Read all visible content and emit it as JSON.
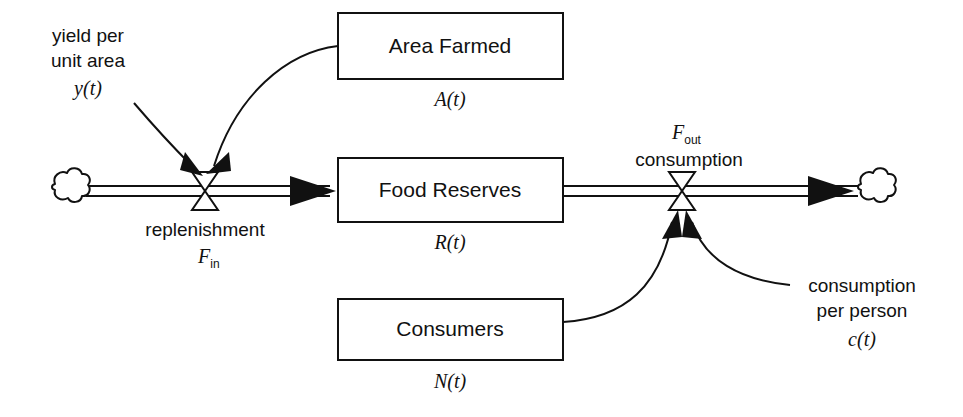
{
  "diagram": {
    "type": "system-dynamics-stock-and-flow",
    "colors": {
      "stroke": "#111111",
      "fill": "#ffffff",
      "background": "#ffffff"
    },
    "stocks": [
      {
        "id": "area-farmed",
        "label": "Area Farmed",
        "variable": "A(t)",
        "x": 338,
        "y": 13,
        "width": 225,
        "height": 66
      },
      {
        "id": "food-reserves",
        "label": "Food Reserves",
        "variable": "R(t)",
        "x": 338,
        "y": 158,
        "width": 225,
        "height": 64
      },
      {
        "id": "consumers",
        "label": "Consumers",
        "variable": "N(t)",
        "x": 338,
        "y": 299,
        "width": 225,
        "height": 61
      }
    ],
    "flows": [
      {
        "id": "replenishment",
        "label": "replenishment",
        "symbol_base": "F",
        "symbol_subscript": "in",
        "valve_x": 205,
        "valve_y": 191,
        "label_position": "below"
      },
      {
        "id": "consumption",
        "label": "consumption",
        "symbol_base": "F",
        "symbol_subscript": "out",
        "valve_x": 682,
        "valve_y": 191,
        "label_position": "above"
      }
    ],
    "auxiliaries": [
      {
        "id": "yield-per-unit-area",
        "lines": [
          "yield per",
          "unit area"
        ],
        "variable": "y(t)",
        "x": 88,
        "y": 37
      },
      {
        "id": "consumption-per-person",
        "lines": [
          "consumption",
          "per person"
        ],
        "variable": "c(t)",
        "x": 862,
        "y": 287
      }
    ],
    "clouds": [
      {
        "id": "source-cloud",
        "x": 66,
        "y": 191
      },
      {
        "id": "sink-cloud",
        "x": 872,
        "y": 191
      }
    ],
    "links": [
      {
        "id": "link-yield-to-replenishment",
        "from": "yield-per-unit-area",
        "to": "replenishment"
      },
      {
        "id": "link-area-to-replenishment",
        "from": "area-farmed",
        "to": "replenishment"
      },
      {
        "id": "link-consumers-to-consumption",
        "from": "consumers",
        "to": "consumption"
      },
      {
        "id": "link-cpp-to-consumption",
        "from": "consumption-per-person",
        "to": "consumption"
      }
    ]
  }
}
